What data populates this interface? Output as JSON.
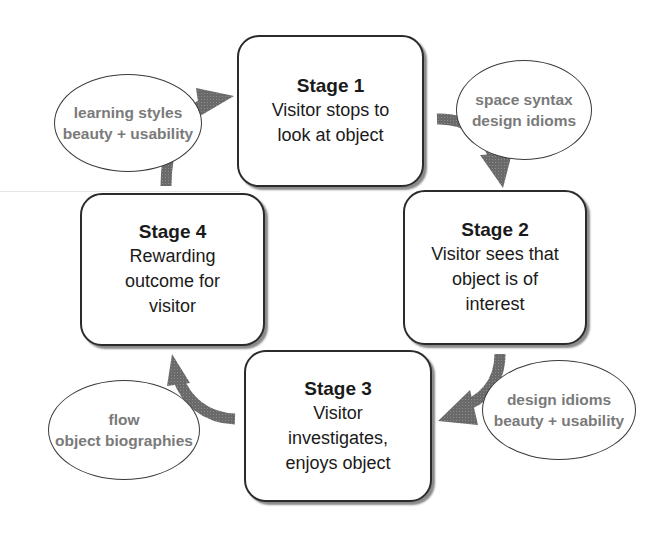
{
  "diagram": {
    "type": "cycle",
    "stages": [
      {
        "id": 1,
        "title": "Stage 1",
        "lines": [
          "Visitor stops to",
          "look at object"
        ]
      },
      {
        "id": 2,
        "title": "Stage 2",
        "lines": [
          "Visitor sees that",
          "object is of",
          "interest"
        ]
      },
      {
        "id": 3,
        "title": "Stage 3",
        "lines": [
          "Visitor",
          "investigates,",
          "enjoys object"
        ]
      },
      {
        "id": 4,
        "title": "Stage 4",
        "lines": [
          "Rewarding",
          "outcome for",
          "visitor"
        ]
      }
    ],
    "notes": [
      {
        "between": "4-1",
        "lines": [
          "learning styles",
          "beauty + usability"
        ]
      },
      {
        "between": "1-2",
        "lines": [
          "space syntax",
          "design idioms"
        ]
      },
      {
        "between": "2-3",
        "lines": [
          "design idioms",
          "beauty + usability"
        ]
      },
      {
        "between": "3-4",
        "lines": [
          "flow",
          "object biographies"
        ]
      }
    ],
    "colors": {
      "box_border": "#2b2b2b",
      "arrow": "#6e6e6e",
      "note_text": "#7a7a7a",
      "stage_text": "#1a1a1a"
    }
  }
}
